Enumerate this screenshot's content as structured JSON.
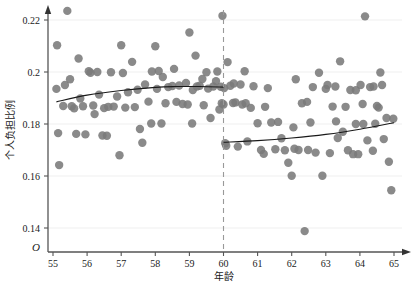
{
  "chart_data": {
    "type": "scatter",
    "title": "",
    "xlabel": "年龄",
    "ylabel": "个人负担比例",
    "origin_label": "O",
    "xlim": [
      55,
      65
    ],
    "ylim": [
      0.13,
      0.228
    ],
    "xticks": [
      55,
      56,
      57,
      58,
      59,
      60,
      61,
      62,
      63,
      64,
      65
    ],
    "xtick_labels": [
      "55",
      "56",
      "57",
      "58",
      "59",
      "60",
      "61",
      "62",
      "63",
      "64",
      "65"
    ],
    "yticks": [
      0.14,
      0.16,
      0.18,
      0.2,
      0.22
    ],
    "ytick_labels": [
      "0.14",
      "0.16",
      "0.18",
      "0.2",
      "0.22"
    ],
    "grid": "horizontal-faint",
    "legend": "none",
    "point_color": "#7a7a7a",
    "point_radius": 4.2,
    "curve_color": "#1a1a1a",
    "cutoff_line": {
      "x": 60,
      "style": "dashed",
      "color": "#999999"
    },
    "annotations": [
      {
        "text": "年龄",
        "role": "x-axis-title"
      },
      {
        "text": "个人负担比例",
        "role": "y-axis-title"
      }
    ],
    "series": [
      {
        "name": "个人负担比例散点",
        "points": [
          [
            55.1,
            0.1935
          ],
          [
            55.12,
            0.2103
          ],
          [
            55.15,
            0.1765
          ],
          [
            55.18,
            0.1642
          ],
          [
            55.3,
            0.1869
          ],
          [
            55.42,
            0.2235
          ],
          [
            55.5,
            0.1972
          ],
          [
            55.55,
            0.1868
          ],
          [
            55.62,
            0.186
          ],
          [
            55.75,
            0.2052
          ],
          [
            55.8,
            0.1898
          ],
          [
            55.88,
            0.1868
          ],
          [
            55.95,
            0.176
          ],
          [
            56.05,
            0.2003
          ],
          [
            56.1,
            0.1997
          ],
          [
            56.18,
            0.1871
          ],
          [
            56.22,
            0.1838
          ],
          [
            56.35,
            0.1913
          ],
          [
            56.45,
            0.1756
          ],
          [
            56.5,
            0.1861
          ],
          [
            56.58,
            0.1755
          ],
          [
            56.7,
            0.1999
          ],
          [
            56.78,
            0.1867
          ],
          [
            56.88,
            0.1906
          ],
          [
            56.95,
            0.168
          ],
          [
            57.0,
            0.2103
          ],
          [
            57.05,
            0.1996
          ],
          [
            57.12,
            0.1863
          ],
          [
            57.2,
            0.1922
          ],
          [
            57.32,
            0.2039
          ],
          [
            57.4,
            0.1865
          ],
          [
            57.48,
            0.1932
          ],
          [
            57.55,
            0.1781
          ],
          [
            57.7,
            0.1952
          ],
          [
            57.8,
            0.1886
          ],
          [
            57.88,
            0.1802
          ],
          [
            58.0,
            0.2099
          ],
          [
            58.05,
            0.1935
          ],
          [
            58.1,
            0.2004
          ],
          [
            58.22,
            0.1981
          ],
          [
            58.3,
            0.188
          ],
          [
            58.38,
            0.1942
          ],
          [
            58.5,
            0.1946
          ],
          [
            58.55,
            0.2012
          ],
          [
            58.62,
            0.1885
          ],
          [
            58.7,
            0.1948
          ],
          [
            58.8,
            0.1877
          ],
          [
            58.9,
            0.1958
          ],
          [
            59.0,
            0.2152
          ],
          [
            59.1,
            0.1931
          ],
          [
            59.18,
            0.2063
          ],
          [
            59.22,
            0.1944
          ],
          [
            59.3,
            0.1947
          ],
          [
            59.38,
            0.1973
          ],
          [
            59.42,
            0.1872
          ],
          [
            59.5,
            0.1999
          ],
          [
            59.55,
            0.1936
          ],
          [
            59.62,
            0.1823
          ],
          [
            59.7,
            0.1944
          ],
          [
            59.78,
            0.1965
          ],
          [
            59.82,
            0.2002
          ],
          [
            59.88,
            0.1856
          ],
          [
            59.92,
            0.1943
          ],
          [
            59.95,
            0.188
          ],
          [
            59.97,
            0.2216
          ],
          [
            60.0,
            0.1875
          ],
          [
            60.02,
            0.1938
          ],
          [
            60.05,
            0.1726
          ],
          [
            60.08,
            0.1716
          ],
          [
            60.12,
            0.2038
          ],
          [
            60.2,
            0.1947
          ],
          [
            60.28,
            0.1881
          ],
          [
            60.35,
            0.1883
          ],
          [
            60.42,
            0.1713
          ],
          [
            60.5,
            0.1952
          ],
          [
            60.55,
            0.1875
          ],
          [
            60.62,
            0.2003
          ],
          [
            60.7,
            0.1733
          ],
          [
            60.8,
            0.1862
          ],
          [
            60.88,
            0.1945
          ],
          [
            61.0,
            0.1803
          ],
          [
            61.1,
            0.17
          ],
          [
            61.18,
            0.1685
          ],
          [
            61.3,
            0.1938
          ],
          [
            61.4,
            0.1806
          ],
          [
            61.52,
            0.1703
          ],
          [
            61.6,
            0.1808
          ],
          [
            61.7,
            0.1745
          ],
          [
            61.8,
            0.1699
          ],
          [
            61.9,
            0.1651
          ],
          [
            62.0,
            0.1601
          ],
          [
            62.05,
            0.1787
          ],
          [
            62.12,
            0.1972
          ],
          [
            62.2,
            0.17
          ],
          [
            62.3,
            0.188
          ],
          [
            62.38,
            0.1388
          ],
          [
            62.45,
            0.1885
          ],
          [
            62.55,
            0.1806
          ],
          [
            62.62,
            0.1942
          ],
          [
            62.7,
            0.169
          ],
          [
            62.8,
            0.1997
          ],
          [
            62.9,
            0.1601
          ],
          [
            63.0,
            0.1935
          ],
          [
            63.05,
            0.195
          ],
          [
            63.12,
            0.1688
          ],
          [
            63.2,
            0.1867
          ],
          [
            63.28,
            0.1944
          ],
          [
            63.35,
            0.1746
          ],
          [
            63.42,
            0.2041
          ],
          [
            63.5,
            0.177
          ],
          [
            63.58,
            0.1866
          ],
          [
            63.65,
            0.1699
          ],
          [
            63.72,
            0.1931
          ],
          [
            63.8,
            0.1684
          ],
          [
            63.88,
            0.193
          ],
          [
            63.95,
            0.1684
          ],
          [
            64.02,
            0.195
          ],
          [
            64.08,
            0.1877
          ],
          [
            64.15,
            0.2214
          ],
          [
            64.22,
            0.1737
          ],
          [
            64.3,
            0.1942
          ],
          [
            64.38,
            0.1697
          ],
          [
            64.45,
            0.1801
          ],
          [
            64.5,
            0.1869
          ],
          [
            64.55,
            0.1863
          ],
          [
            64.6,
            0.1998
          ],
          [
            64.65,
            0.195
          ],
          [
            64.7,
            0.1742
          ],
          [
            64.78,
            0.1823
          ],
          [
            64.85,
            0.1655
          ],
          [
            64.92,
            0.1545
          ],
          [
            64.98,
            0.182
          ],
          [
            55.35,
            0.195
          ],
          [
            56.62,
            0.1866
          ],
          [
            57.62,
            0.1728
          ],
          [
            58.18,
            0.1802
          ],
          [
            59.08,
            0.1802
          ],
          [
            60.3,
            0.1956
          ],
          [
            61.22,
            0.1866
          ],
          [
            62.08,
            0.1705
          ],
          [
            63.3,
            0.181
          ],
          [
            64.1,
            0.18
          ],
          [
            55.68,
            0.1762
          ],
          [
            56.3,
            0.2
          ],
          [
            57.9,
            0.2002
          ],
          [
            58.95,
            0.1875
          ],
          [
            60.65,
            0.188
          ],
          [
            62.48,
            0.17
          ],
          [
            63.88,
            0.18
          ],
          [
            64.4,
            0.1944
          ]
        ]
      }
    ],
    "fit_curves": [
      {
        "name": "拟合曲线（60岁前）",
        "segment": "pre-cutoff",
        "x_range": [
          55.1,
          60.0
        ],
        "points": [
          [
            55.1,
            0.1885
          ],
          [
            56.0,
            0.1911
          ],
          [
            57.0,
            0.1929
          ],
          [
            58.0,
            0.1941
          ],
          [
            58.6,
            0.1944
          ],
          [
            59.3,
            0.1944
          ],
          [
            60.0,
            0.1942
          ]
        ]
      },
      {
        "name": "拟合曲线（60岁后）",
        "segment": "post-cutoff",
        "x_range": [
          60.0,
          65.0
        ],
        "points": [
          [
            60.0,
            0.173
          ],
          [
            61.0,
            0.1736
          ],
          [
            62.0,
            0.1746
          ],
          [
            63.0,
            0.176
          ],
          [
            64.0,
            0.178
          ],
          [
            65.0,
            0.1805
          ]
        ]
      }
    ]
  }
}
